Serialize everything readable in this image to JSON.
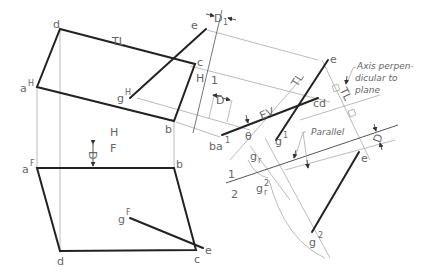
{
  "figure": {
    "colors": {
      "object_line": "#222222",
      "projection_line": "#aaaaaa",
      "fold_line_start": "#e05070",
      "fold_line_end": "#6aa0b0",
      "label": "#666666"
    }
  },
  "top_view": {
    "vertices": {
      "a": "a",
      "a_sup": "H",
      "b": "b",
      "c": "c",
      "d": "d",
      "e": "e",
      "g": "g",
      "g_sup": "H"
    },
    "tl_label": "TL"
  },
  "front_view": {
    "vertices": {
      "a": "a",
      "a_sup": "F",
      "b": "b",
      "c": "c",
      "d": "d",
      "e": "e",
      "g": "g",
      "g_sup": "F"
    },
    "dim_label": "D"
  },
  "fold_lines": {
    "hf_top": "H",
    "hf_bottom": "F",
    "h1_left": "H",
    "h1_right": "1",
    "one_two_top": "1",
    "one_two_bottom": "2"
  },
  "aux_view_1": {
    "edge_label": "ba",
    "edge_sup": "1",
    "cd_label": "cd",
    "e_label": "e",
    "g_label": "g",
    "g_sup": "1",
    "ev_label": "EV",
    "tl_label": "TL",
    "theta_label": "θ",
    "gr_label": "g",
    "gr_sub": "r",
    "dim_D1": "D",
    "dim_D1_sub": "1",
    "dim_D": "D"
  },
  "aux_view_2": {
    "e_label": "e",
    "g_label": "g",
    "g_sup": "2",
    "gr_label": "g",
    "gr_sub": "r",
    "gr_sup": "2",
    "tl_label": "TL",
    "dim_D": "D"
  },
  "annotations": {
    "axis_line1": "Axis perpen-",
    "axis_line2": "dicular to",
    "axis_line3": "plane",
    "parallel": "Parallel"
  }
}
